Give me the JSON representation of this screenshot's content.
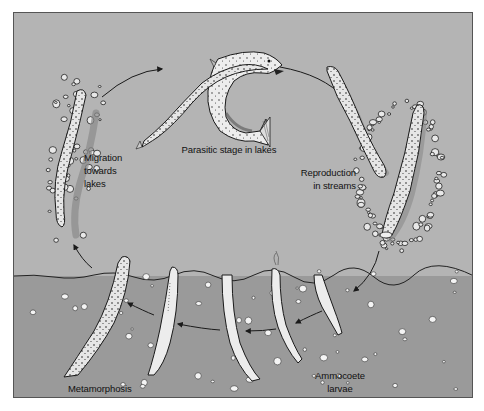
{
  "diagram": {
    "colors": {
      "water": "#b4b4b4",
      "sediment": "#9a9a9a",
      "frame": "#555555",
      "ink": "#1a1a1a",
      "pebble_fill": "#f2f2f2"
    },
    "labels": {
      "parasitic": "Parasitic stage in lakes",
      "migration_line1": "Migration",
      "migration_line2": "towards",
      "migration_line3": "lakes",
      "reproduction_line1": "Reproduction",
      "reproduction_line2": "in streams",
      "metamorphosis": "Metamorphosis",
      "larvae_line1": "Ammocoete",
      "larvae_line2": "larvae"
    },
    "stages": [
      {
        "id": "parasitic",
        "name": "Parasitic stage in lakes",
        "icon": "lamprey-attached-to-trout"
      },
      {
        "id": "reproduction",
        "name": "Reproduction in streams",
        "icon": "spawning-lampreys-in-nest"
      },
      {
        "id": "larvae",
        "name": "Ammocoete larvae",
        "icon": "burrowed-larvae"
      },
      {
        "id": "metamorphosis",
        "name": "Metamorphosis",
        "icon": "transforming-larva"
      },
      {
        "id": "migration",
        "name": "Migration towards lakes",
        "icon": "migrating-adult-lamprey"
      }
    ],
    "cycle_order": [
      "parasitic",
      "reproduction",
      "larvae",
      "metamorphosis",
      "migration"
    ]
  }
}
